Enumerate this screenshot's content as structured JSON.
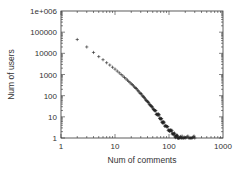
{
  "chart_data": {
    "type": "scatter",
    "title": "",
    "xlabel": "Num of comments",
    "ylabel": "Num of users",
    "xscale": "log",
    "yscale": "log",
    "xlim": [
      1,
      1000
    ],
    "ylim": [
      1,
      1000000
    ],
    "x_ticks": [
      {
        "value": 1,
        "label": "1"
      },
      {
        "value": 10,
        "label": "10"
      },
      {
        "value": 100,
        "label": "100"
      },
      {
        "value": 1000,
        "label": "1000"
      }
    ],
    "y_ticks": [
      {
        "value": 1,
        "label": "1"
      },
      {
        "value": 10,
        "label": "10"
      },
      {
        "value": 100,
        "label": "100"
      },
      {
        "value": 1000,
        "label": "1000"
      },
      {
        "value": 10000,
        "label": "10000"
      },
      {
        "value": 100000,
        "label": "100000"
      },
      {
        "value": 1000000,
        "label": "1e+006"
      }
    ],
    "grid": false,
    "legend": null,
    "marker": "+",
    "marker_color": "#222222",
    "series": [
      {
        "name": "users per comment count",
        "x": [
          2,
          3,
          4,
          5,
          6,
          7,
          8,
          9,
          10,
          11,
          12,
          13,
          14,
          15,
          16,
          17,
          18,
          19,
          20,
          22,
          24,
          26,
          28,
          30,
          33,
          36,
          40,
          45,
          50,
          55,
          60,
          65,
          70,
          75,
          80,
          90,
          100,
          110,
          120,
          130,
          140,
          150,
          170,
          200,
          250,
          300
        ],
        "y": [
          45000,
          20000,
          11000,
          7000,
          5000,
          3600,
          2800,
          2200,
          1800,
          1450,
          1200,
          1000,
          850,
          720,
          620,
          540,
          470,
          410,
          360,
          290,
          230,
          185,
          150,
          125,
          95,
          72,
          52,
          36,
          26,
          19,
          14,
          11,
          8,
          6,
          5,
          3.5,
          2.5,
          2,
          1.6,
          1.3,
          1.2,
          1,
          1,
          1,
          1,
          1
        ]
      }
    ],
    "annotations": []
  },
  "axes": {
    "x_title": "Num of comments",
    "y_title": "Num of users"
  }
}
